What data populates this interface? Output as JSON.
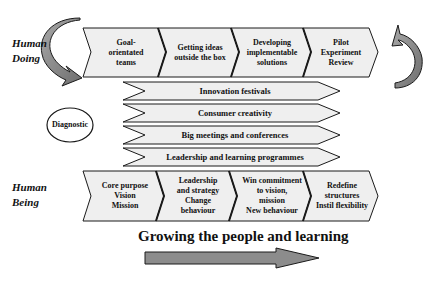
{
  "diagram": {
    "side_labels": {
      "top": "Human\nDoing",
      "bottom": "Human\nBeing"
    },
    "top_row": [
      {
        "label": "Goal-\norientated\nteams"
      },
      {
        "label": "Getting ideas\noutside the box"
      },
      {
        "label": "Developing\nimplementable\nsolutions"
      },
      {
        "label": "Pilot\nExperiment\nReview"
      }
    ],
    "middle_bands": [
      {
        "label": "Innovation festivals"
      },
      {
        "label": "Consumer creativity"
      },
      {
        "label": "Big meetings and conferences"
      },
      {
        "label": "Leadership and learning programmes"
      }
    ],
    "diagnostic": "Diagnostic",
    "bottom_row": [
      {
        "label": "Core purpose\nVision\nMission"
      },
      {
        "label": "Leadership\nand strategy\nChange\nbehaviour"
      },
      {
        "label": "Win commitment\nto vision,\nmission\nNew behaviour"
      },
      {
        "label": "Redefine\nstructures\nInstil flexibility"
      }
    ],
    "footer_title": "Growing the people and learning",
    "colors": {
      "chevron_fill": "#efefef",
      "arrow_fill": "#8c8c8c",
      "stroke": "#1a1a1a"
    }
  }
}
